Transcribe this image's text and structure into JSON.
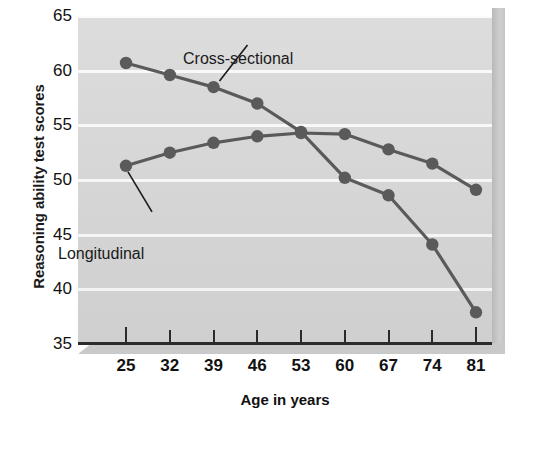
{
  "chart_data": {
    "type": "line",
    "title": "",
    "xlabel": "Age in years",
    "ylabel": "Reasoning ability test scores",
    "x": [
      25,
      32,
      39,
      46,
      53,
      60,
      67,
      74,
      81
    ],
    "xtick_labels": [
      "25",
      "32",
      "39",
      "46",
      "53",
      "60",
      "67",
      "74",
      "81"
    ],
    "ytick_labels": [
      "65",
      "60",
      "55",
      "50",
      "45",
      "40",
      "35"
    ],
    "yticks": [
      65,
      60,
      55,
      50,
      45,
      40,
      35
    ],
    "ylim": [
      35,
      65
    ],
    "xlim": [
      25,
      81
    ],
    "grid": "horizontal",
    "legend": "inline-annotations",
    "series": [
      {
        "name": "Cross-sectional",
        "values": [
          60.7,
          59.6,
          58.5,
          57.0,
          54.4,
          50.2,
          48.6,
          44.1,
          37.9
        ],
        "color": "#5a5a5a"
      },
      {
        "name": "Longitudinal",
        "values": [
          51.3,
          52.5,
          53.4,
          54.0,
          54.3,
          54.2,
          52.8,
          51.5,
          49.1
        ],
        "color": "#5a5a5a"
      }
    ],
    "annotations": [
      {
        "text": "Cross-sectional",
        "points_to": "age 39 on cross-sectional line"
      },
      {
        "text": "Longitudinal",
        "points_to": "age 25 on longitudinal line"
      }
    ]
  },
  "credit": {
    "text": "Adapted from Schaie, 1994, with permission."
  },
  "colors": {
    "plot_background": "#d6d6d6",
    "gridline": "#fafafa",
    "series_line": "#5a5a5a",
    "axis": "#2b2b2b",
    "text": "#111111",
    "shadow": "#c4c4c4"
  }
}
